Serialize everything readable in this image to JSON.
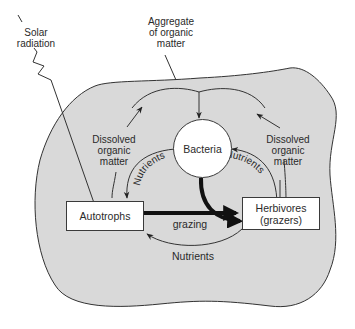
{
  "diagram": {
    "labels": {
      "solar_radiation": "Solar radiation",
      "aggregate": "Aggregate of organic matter",
      "dom_left": "Dissolved organic matter",
      "dom_right": "Dissolved organic matter",
      "nutrients_left": "Nutrients",
      "nutrients_right": "Nutrients",
      "nutrients_bottom": "Nutrients",
      "grazing": "grazing"
    },
    "nodes": {
      "bacteria": "Bacteria",
      "autotrophs": "Autotrophs",
      "herbivores_line1": "Herbivores",
      "herbivores_line2": "(grazers)"
    },
    "label_lines": {
      "solar_1": "Solar",
      "solar_2": "radiation",
      "agg_1": "Aggregate",
      "agg_2": "of organic",
      "agg_3": "matter",
      "doml_1": "Dissolved",
      "doml_2": "organic",
      "doml_3": "matter",
      "domr_1": "Dissolved",
      "domr_2": "organic",
      "domr_3": "matter"
    },
    "edges": [
      {
        "from": "Solar radiation",
        "to": "Autotrophs"
      },
      {
        "from": "Autotrophs",
        "to": "Aggregate of organic matter",
        "label": "Dissolved organic matter"
      },
      {
        "from": "Herbivores",
        "to": "Aggregate of organic matter",
        "label": "Dissolved organic matter"
      },
      {
        "from": "Aggregate of organic matter",
        "to": "Bacteria"
      },
      {
        "from": "Bacteria",
        "to": "Autotrophs",
        "label": "Nutrients"
      },
      {
        "from": "Herbivores",
        "to": "Bacteria",
        "label": "Nutrients"
      },
      {
        "from": "Bacteria",
        "to": "Herbivores",
        "style": "thick"
      },
      {
        "from": "Autotrophs",
        "to": "Herbivores",
        "label": "grazing",
        "style": "thick"
      },
      {
        "from": "Herbivores",
        "to": "Autotrophs",
        "label": "Nutrients"
      }
    ],
    "colors": {
      "aggregate_fill": "#d9d9d9",
      "stroke": "#333333",
      "node_fill": "#ffffff"
    }
  }
}
